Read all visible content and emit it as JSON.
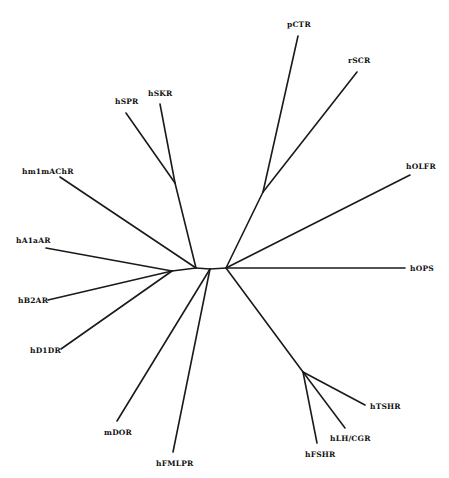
{
  "diagram": {
    "type": "unrooted phylogenetic tree",
    "line_color": "#1a1a1a",
    "background": "#ffffff",
    "taxa": [
      {
        "id": "pCTR",
        "label": "pCTR",
        "x": 287,
        "y": 24
      },
      {
        "id": "rSCR",
        "label": "rSCR",
        "x": 348,
        "y": 60
      },
      {
        "id": "hSPR",
        "label": "hSPR",
        "x": 117,
        "y": 100
      },
      {
        "id": "hSKR",
        "label": "hSKR",
        "x": 149,
        "y": 92
      },
      {
        "id": "hm1mAChR",
        "label": "hm1mAChR",
        "x": 22,
        "y": 171
      },
      {
        "id": "hOLFR",
        "label": "hOLFR",
        "x": 406,
        "y": 166
      },
      {
        "id": "hA1aAR",
        "label": "hA1aAR",
        "x": 16,
        "y": 240
      },
      {
        "id": "hOPS",
        "label": "hOPS",
        "x": 410,
        "y": 266
      },
      {
        "id": "hB2AR",
        "label": "hB2AR",
        "x": 18,
        "y": 299
      },
      {
        "id": "hD1DR",
        "label": "hD1DR",
        "x": 30,
        "y": 349
      },
      {
        "id": "mDOR",
        "label": "mDOR",
        "x": 104,
        "y": 431
      },
      {
        "id": "hTSHR",
        "label": "hTSHR",
        "x": 370,
        "y": 405
      },
      {
        "id": "hLH/CGR",
        "label": "hLH/CGR",
        "x": 330,
        "y": 437
      },
      {
        "id": "hFSHR",
        "label": "hFSHR",
        "x": 306,
        "y": 452
      },
      {
        "id": "hFMLPR",
        "label": "hFMLPR",
        "x": 156,
        "y": 462
      }
    ],
    "internal_nodes": {
      "n_left_join": {
        "x": 172,
        "y": 271
      },
      "n_center_left": {
        "x": 196,
        "y": 268
      },
      "n_center_mid": {
        "x": 210,
        "y": 269
      },
      "n_center_right": {
        "x": 226,
        "y": 268
      },
      "n_skr_spr": {
        "x": 175,
        "y": 183
      },
      "n_ctr_scr": {
        "x": 263,
        "y": 192
      },
      "n_gly": {
        "x": 303,
        "y": 372
      }
    },
    "branches": [
      [
        "n_center_left",
        "n_center_mid"
      ],
      [
        "n_center_mid",
        "n_center_right"
      ],
      [
        "n_center_left",
        "n_left_join"
      ],
      [
        "n_left_join",
        "hA1aAR"
      ],
      [
        "n_left_join",
        "hB2AR"
      ],
      [
        "n_left_join",
        "hD1DR"
      ],
      [
        "n_center_left",
        "hm1mAChR"
      ],
      [
        "n_center_left",
        "n_skr_spr"
      ],
      [
        "n_skr_spr",
        "hSPR"
      ],
      [
        "n_skr_spr",
        "hSKR"
      ],
      [
        "n_center_mid",
        "mDOR"
      ],
      [
        "n_center_mid",
        "hFMLPR"
      ],
      [
        "n_center_right",
        "n_ctr_scr"
      ],
      [
        "n_ctr_scr",
        "pCTR"
      ],
      [
        "n_ctr_scr",
        "rSCR"
      ],
      [
        "n_center_right",
        "hOLFR"
      ],
      [
        "n_center_right",
        "hOPS"
      ],
      [
        "n_center_right",
        "n_gly"
      ],
      [
        "n_gly",
        "hTSHR"
      ],
      [
        "n_gly",
        "hLH/CGR"
      ],
      [
        "n_gly",
        "hFSHR"
      ]
    ]
  },
  "labels": {
    "pCTR": "pCTR",
    "rSCR": "rSCR",
    "hSPR": "hSPR",
    "hSKR": "hSKR",
    "hm1mAChR": "hm1mAChR",
    "hOLFR": "hOLFR",
    "hA1aAR": "hA1aAR",
    "hOPS": "hOPS",
    "hB2AR": "hB2AR",
    "hD1DR": "hD1DR",
    "mDOR": "mDOR",
    "hTSHR": "hTSHR",
    "hLHCGR": "hLH/CGR",
    "hFSHR": "hFSHR",
    "hFMLPR": "hFMLPR"
  }
}
